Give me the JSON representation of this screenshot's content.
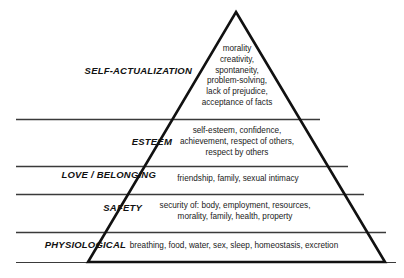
{
  "diagram": {
    "type": "pyramid",
    "name": "Maslow's Hierarchy of Needs",
    "tier_count": 5,
    "colors": {
      "stroke": "#111111",
      "background": "#ffffff",
      "text": "#1a1a1a"
    },
    "tiers": [
      {
        "id": "self-actualization",
        "label": "SELF-ACTUALIZATION",
        "description": "morality\ncreativity,\nspontaneity,\nproblem-solving,\nlack of prejudice,\nacceptance of facts"
      },
      {
        "id": "esteem",
        "label": "ESTEEM",
        "description": "self-esteem, confidence,\nachievement, respect of others,\nrespect by others"
      },
      {
        "id": "love-belonging",
        "label": "LOVE / BELONGING",
        "description": "friendship, family, sexual intimacy"
      },
      {
        "id": "safety",
        "label": "SAFETY",
        "description": "security of: body, employment, resources,\nmorality, family, health, property"
      },
      {
        "id": "physiological",
        "label": "PHYSIOLOGICAL",
        "description": "breathing, food, water, sex, sleep, homeostasis, excretion"
      }
    ]
  }
}
